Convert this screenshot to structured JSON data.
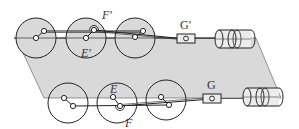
{
  "diagram": {
    "title": "",
    "colors": {
      "plane_fill": "#d9d9d9",
      "stroke": "#222222",
      "wheel_fill_top": "#d9d9d9",
      "background": "#ffffff"
    },
    "labels": {
      "F_prime": "F′",
      "E_prime": "E′",
      "G_prime": "G′",
      "E": "E",
      "F": "F",
      "G": "G"
    },
    "top_row": {
      "wheels": [
        {
          "cx": 36,
          "cy": 38,
          "r": 20
        },
        {
          "cx": 86,
          "cy": 38,
          "r": 20
        },
        {
          "cx": 135,
          "cy": 38,
          "r": 20
        }
      ],
      "slider_box": {
        "x": 177,
        "y": 34,
        "w": 18,
        "h": 9,
        "label": "G′"
      },
      "cylinder": {
        "x": 215,
        "y": 30,
        "w": 40,
        "h": 18
      }
    },
    "bottom_row": {
      "wheels": [
        {
          "cx": 68,
          "cy": 103,
          "r": 20
        },
        {
          "cx": 117,
          "cy": 103,
          "r": 20
        },
        {
          "cx": 166,
          "cy": 100,
          "r": 20
        }
      ],
      "slider_box": {
        "x": 203,
        "y": 94,
        "w": 18,
        "h": 9,
        "label": "G"
      },
      "cylinder": {
        "x": 243,
        "y": 88,
        "w": 40,
        "h": 18
      }
    }
  }
}
